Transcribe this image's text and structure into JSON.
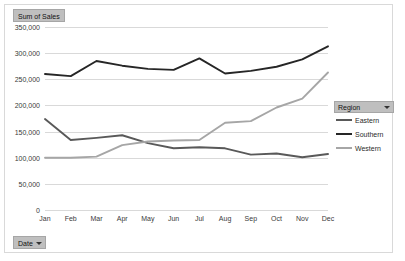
{
  "field_buttons": {
    "value_field": {
      "label": "Sum of Sales",
      "caret": "chevron-down-icon"
    },
    "axis_field": {
      "label": "Date",
      "caret": "chevron-down-icon"
    }
  },
  "legend": {
    "header": {
      "label": "Region",
      "caret": "chevron-down-icon"
    },
    "entries": [
      {
        "label": "Eastern",
        "color": "#595959"
      },
      {
        "label": "Southern",
        "color": "#262626"
      },
      {
        "label": "Western",
        "color": "#a6a6a6"
      }
    ]
  },
  "chart_data": {
    "type": "line",
    "title": "Sum of Sales",
    "xlabel": "",
    "ylabel": "",
    "grid": true,
    "legend_position": "right",
    "ylim": [
      0,
      350000
    ],
    "ytick_step": 50000,
    "ytick_labels": [
      "0",
      "50,000",
      "100,000",
      "150,000",
      "200,000",
      "250,000",
      "300,000",
      "350,000"
    ],
    "ytick_values": [
      0,
      50000,
      100000,
      150000,
      200000,
      250000,
      300000,
      350000
    ],
    "categories": [
      "Jan",
      "Feb",
      "Mar",
      "Apr",
      "May",
      "Jun",
      "Jul",
      "Aug",
      "Sep",
      "Oct",
      "Nov",
      "Dec"
    ],
    "series": [
      {
        "name": "Eastern",
        "color": "#595959",
        "values": [
          174000,
          134000,
          138000,
          143000,
          128000,
          118000,
          120000,
          118000,
          106000,
          108000,
          101000,
          107000
        ]
      },
      {
        "name": "Southern",
        "color": "#262626",
        "values": [
          260000,
          256000,
          285000,
          276000,
          270000,
          268000,
          290000,
          261000,
          266000,
          274000,
          288000,
          313000
        ]
      },
      {
        "name": "Western",
        "color": "#a6a6a6",
        "values": [
          100000,
          100000,
          102000,
          124000,
          131000,
          133000,
          134000,
          167000,
          170000,
          196000,
          213000,
          263000
        ]
      }
    ]
  }
}
